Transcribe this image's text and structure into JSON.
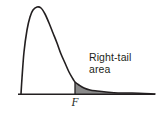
{
  "figure": {
    "kind": "probability-density-curve",
    "background_color": "#ffffff",
    "curve_color": "#231f20",
    "axis_color": "#231f20",
    "shade_color": "#8a8a8a",
    "text_color": "#231f20"
  },
  "annotation": {
    "line1": "Right-tail",
    "line2": "area"
  },
  "axis": {
    "tick_label": "F"
  },
  "chart_data": {
    "type": "area",
    "title": "",
    "subtitle": "",
    "xlabel": "",
    "ylabel": "",
    "grid": false,
    "legend": null,
    "xlim": [
      18,
      155
    ],
    "ylim": [
      0,
      94
    ],
    "baseline_y": 94,
    "axis_x_start": 18,
    "axis_x_end": 155,
    "peak": {
      "x": 37,
      "y": 7
    },
    "left_foot": {
      "x": 21,
      "y": 94
    },
    "critical_value": {
      "label": "F",
      "x": 75,
      "curve_y": 82
    },
    "shaded_region": {
      "from_x": 75,
      "to_x": 155,
      "fill": "#8a8a8a"
    },
    "curve_points": [
      [
        21,
        94
      ],
      [
        22,
        78
      ],
      [
        24,
        52
      ],
      [
        27,
        30
      ],
      [
        30,
        17
      ],
      [
        33,
        10
      ],
      [
        37,
        7
      ],
      [
        41,
        8
      ],
      [
        45,
        14
      ],
      [
        49,
        23
      ],
      [
        53,
        33
      ],
      [
        57,
        43
      ],
      [
        61,
        54
      ],
      [
        65,
        63
      ],
      [
        69,
        72
      ],
      [
        73,
        79
      ],
      [
        75,
        82
      ],
      [
        79,
        85
      ],
      [
        84,
        88
      ],
      [
        90,
        90
      ],
      [
        97,
        91
      ],
      [
        106,
        92
      ],
      [
        118,
        93
      ],
      [
        132,
        93
      ],
      [
        155,
        94
      ]
    ],
    "annotations": [
      {
        "text": "Right-tail area",
        "x": 89,
        "y": 51,
        "points_to": "shaded-region"
      },
      {
        "text": "F",
        "x": 75,
        "y": 101,
        "points_to": "x-axis-critical-value"
      }
    ]
  }
}
